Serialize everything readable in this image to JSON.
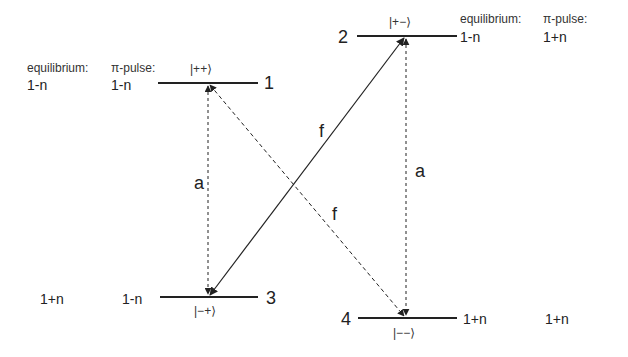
{
  "levels": [
    {
      "id": "1",
      "number_label": "1",
      "ket": "|++⟩",
      "equilibrium": "1-n",
      "pi_pulse": "1-n"
    },
    {
      "id": "2",
      "number_label": "2",
      "ket": "|+−⟩",
      "equilibrium": "1-n",
      "pi_pulse": "1+n"
    },
    {
      "id": "3",
      "number_label": "3",
      "ket": "|−+⟩",
      "equilibrium": "1+n",
      "pi_pulse": "1-n"
    },
    {
      "id": "4",
      "number_label": "4",
      "ket": "|−−⟩",
      "equilibrium": "1+n",
      "pi_pulse": "1+n"
    }
  ],
  "headers": {
    "left": {
      "equilibrium": "equilibrium:",
      "pi_pulse": "π-pulse:"
    },
    "right": {
      "equilibrium": "equilibrium:",
      "pi_pulse": "π-pulse:"
    }
  },
  "transitions": [
    {
      "from": "3",
      "to": "1",
      "label": "a",
      "style": "dashed"
    },
    {
      "from": "4",
      "to": "2",
      "label": "a",
      "style": "dashed"
    },
    {
      "from": "3",
      "to": "2",
      "label": "f",
      "style": "solid"
    },
    {
      "from": "1",
      "to": "4",
      "label": "f",
      "style": "dashed"
    }
  ],
  "colors": {
    "line": "#222222",
    "background": "#ffffff"
  }
}
